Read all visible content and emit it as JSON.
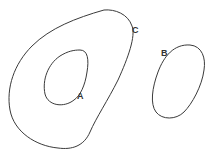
{
  "diagram": {
    "regions": [
      {
        "id": "A",
        "label": "A",
        "description": "inner closed curve inside C"
      },
      {
        "id": "B",
        "label": "B",
        "description": "separate closed curve to the right"
      },
      {
        "id": "C",
        "label": "C",
        "description": "large outer closed curve enclosing A"
      }
    ],
    "labels": {
      "a": "A",
      "b": "B",
      "c": "C"
    },
    "stroke_color": "#3a3a3a",
    "background": "#ffffff"
  }
}
